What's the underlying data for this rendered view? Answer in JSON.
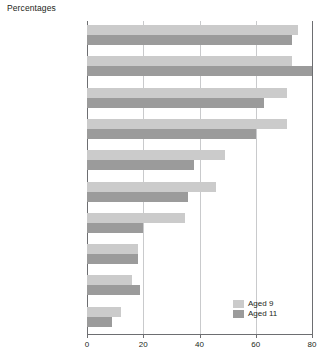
{
  "chart_data": {
    "type": "bar",
    "orientation": "horizontal",
    "title": "Percentages",
    "xlabel": "",
    "ylabel": "",
    "xlim": [
      0,
      80
    ],
    "xticks": [
      "0",
      "20",
      "40",
      "60",
      "80"
    ],
    "grid": true,
    "legend_position": "bottom-right",
    "categories": [
      "I like reading silently\nby myself",
      "I like reading comics\nor magazines",
      "I like reading stories",
      "I enjoy reading",
      "I like reading poems",
      "I like reading\ninformation books",
      "I like reading with an\nadult to help me",
      "I am not interested\nin books",
      "I think reading\nis boring",
      "I think reading\nis difficult"
    ],
    "series": [
      {
        "name": "Aged 9",
        "color": "#cbcbcb",
        "values": [
          75,
          73,
          71,
          71,
          49,
          46,
          35,
          18,
          16,
          12
        ]
      },
      {
        "name": "Aged 11",
        "color": "#9b9b9b",
        "values": [
          73,
          80,
          63,
          60,
          38,
          36,
          20,
          18,
          19,
          9
        ]
      }
    ]
  },
  "legend": {
    "items": [
      {
        "label": "Aged 9"
      },
      {
        "label": "Aged 11"
      }
    ]
  }
}
